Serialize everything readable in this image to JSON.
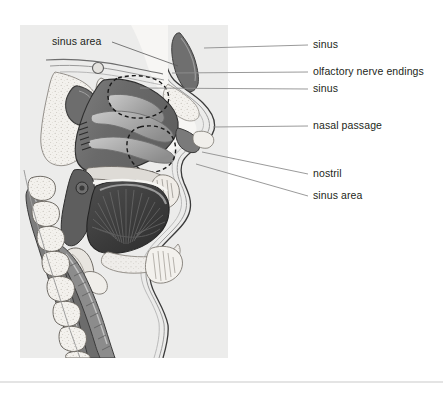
{
  "figure": {
    "panel": {
      "background_color": "#ececeb",
      "x": 20,
      "y": 25,
      "width": 208,
      "height": 333
    },
    "page_background": "#ffffff",
    "divider": {
      "color": "#c9c9c9",
      "y": 382
    }
  },
  "palette": {
    "panel_gray": "#ececeb",
    "tissue_dark": "#6b6b6b",
    "tissue_mid": "#8f8f8f",
    "tissue_light": "#b8b8b8",
    "bone_light": "#f2f0ec",
    "bone_speckle": "#d8d5cf",
    "cavity_dark": "#4a4a4a",
    "tongue_dark": "#3f3f3f",
    "outline": "#333333",
    "leader_line": "#8e8e8e",
    "text": "#231f20"
  },
  "labels": {
    "left": [
      {
        "id": "sinus-area-left",
        "text": "sinus area",
        "x": 52,
        "y": 45,
        "anchor": "start",
        "leader": "M 112 42 L 178 66"
      }
    ],
    "right": [
      {
        "id": "sinus-upper",
        "text": "sinus",
        "x": 313,
        "y": 48,
        "anchor": "start",
        "leader": "M 204 48 L 308 45"
      },
      {
        "id": "olfactory-nerve-endings",
        "text": "olfactory nerve endings",
        "x": 313,
        "y": 75,
        "anchor": "start",
        "leader": "M 172 73 L 308 72"
      },
      {
        "id": "sinus-middle",
        "text": "sinus",
        "x": 313,
        "y": 92,
        "anchor": "start",
        "leader": "M 140 88 L 308 89"
      },
      {
        "id": "nasal-passage",
        "text": "nasal passage",
        "x": 313,
        "y": 129,
        "anchor": "start",
        "leader": "M 213 127 L 308 126"
      },
      {
        "id": "nostril",
        "text": "nostril",
        "x": 313,
        "y": 177,
        "anchor": "start",
        "leader": "M 202 152 L 308 174"
      },
      {
        "id": "sinus-area-right",
        "text": "sinus area",
        "x": 313,
        "y": 199,
        "anchor": "start",
        "leader": "M 196 164 L 308 196"
      }
    ]
  },
  "anatomy_regions": [
    {
      "id": "frontal-sinus",
      "name": "frontal sinus cavity"
    },
    {
      "id": "nasal-cavity",
      "name": "nasal cavity with turbinates"
    },
    {
      "id": "sphenoid-sinus",
      "name": "sphenoid sinus"
    },
    {
      "id": "maxillary-sinus-outline",
      "name": "dashed sinus area outline"
    },
    {
      "id": "tongue",
      "name": "tongue with muscle fibers"
    },
    {
      "id": "hard-palate",
      "name": "hard palate"
    },
    {
      "id": "soft-palate",
      "name": "soft palate"
    },
    {
      "id": "pharynx",
      "name": "pharynx"
    },
    {
      "id": "epiglottis",
      "name": "epiglottis"
    },
    {
      "id": "cervical-vertebrae",
      "name": "cervical vertebrae column"
    },
    {
      "id": "spinal-cord",
      "name": "spinal cord"
    },
    {
      "id": "trachea",
      "name": "trachea"
    },
    {
      "id": "lips",
      "name": "lips"
    },
    {
      "id": "nose-external",
      "name": "external nose"
    }
  ]
}
